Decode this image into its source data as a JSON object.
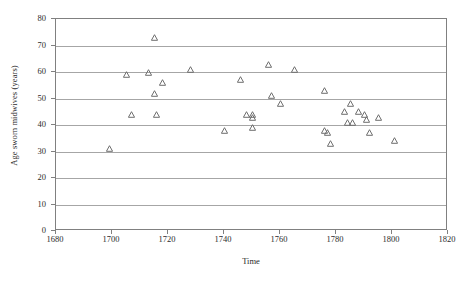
{
  "chart_data": {
    "type": "scatter",
    "title": "",
    "xlabel": "Time",
    "ylabel": "Age sworn midwives (years)",
    "xlim": [
      1680,
      1820
    ],
    "ylim": [
      0,
      80
    ],
    "xticks": [
      1680,
      1700,
      1720,
      1740,
      1760,
      1780,
      1800,
      1820
    ],
    "yticks": [
      0,
      10,
      20,
      30,
      40,
      50,
      60,
      70,
      80
    ],
    "grid": "horizontal",
    "legend": "none",
    "marker": "open-triangle",
    "marker_color": "#6e6e6e",
    "series": [
      {
        "name": "Sworn midwives",
        "points": [
          {
            "x": 1699,
            "y": 31
          },
          {
            "x": 1705,
            "y": 59
          },
          {
            "x": 1707,
            "y": 44
          },
          {
            "x": 1713,
            "y": 60
          },
          {
            "x": 1715,
            "y": 73
          },
          {
            "x": 1715,
            "y": 52
          },
          {
            "x": 1716,
            "y": 44
          },
          {
            "x": 1718,
            "y": 56
          },
          {
            "x": 1728,
            "y": 61
          },
          {
            "x": 1740,
            "y": 38
          },
          {
            "x": 1746,
            "y": 57
          },
          {
            "x": 1748,
            "y": 44
          },
          {
            "x": 1750,
            "y": 44
          },
          {
            "x": 1750,
            "y": 43
          },
          {
            "x": 1750,
            "y": 39
          },
          {
            "x": 1756,
            "y": 63
          },
          {
            "x": 1757,
            "y": 51
          },
          {
            "x": 1760,
            "y": 48
          },
          {
            "x": 1765,
            "y": 61
          },
          {
            "x": 1776,
            "y": 53
          },
          {
            "x": 1776,
            "y": 38
          },
          {
            "x": 1777,
            "y": 37
          },
          {
            "x": 1778,
            "y": 33
          },
          {
            "x": 1783,
            "y": 45
          },
          {
            "x": 1784,
            "y": 41
          },
          {
            "x": 1785,
            "y": 48
          },
          {
            "x": 1786,
            "y": 41
          },
          {
            "x": 1788,
            "y": 45
          },
          {
            "x": 1790,
            "y": 44
          },
          {
            "x": 1791,
            "y": 42
          },
          {
            "x": 1792,
            "y": 37
          },
          {
            "x": 1795,
            "y": 43
          },
          {
            "x": 1801,
            "y": 34
          }
        ]
      }
    ]
  }
}
